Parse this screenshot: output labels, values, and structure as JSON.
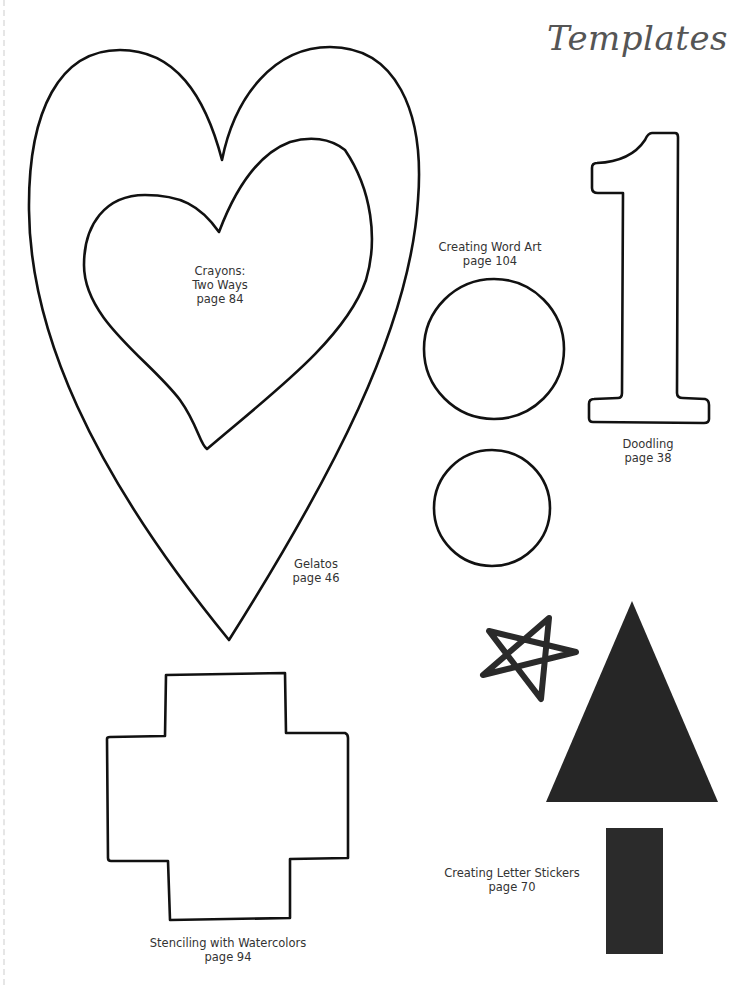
{
  "page": {
    "title": "Templates",
    "colors": {
      "outline": "#111111",
      "fill_dark": "#262626",
      "title": "#555555",
      "label": "#333333"
    }
  },
  "templates": [
    {
      "id": "heart-outer",
      "shape": "heart-outline",
      "label_lines": [
        "Gelatos",
        "page 46"
      ]
    },
    {
      "id": "heart-inner",
      "shape": "heart-outline",
      "label_lines": [
        "Crayons:",
        "Two Ways",
        "page 84"
      ]
    },
    {
      "id": "circles",
      "shape": "circle-outline",
      "count": 2,
      "label_lines": [
        "Creating Word Art",
        "page 104"
      ]
    },
    {
      "id": "number-one",
      "shape": "number-1-outline",
      "label_lines": [
        "Doodling",
        "page 38"
      ]
    },
    {
      "id": "cross",
      "shape": "cross-outline",
      "label_lines": [
        "Stenciling with Watercolors",
        "page 94"
      ]
    },
    {
      "id": "tree",
      "shape": "star-triangle-rectangle-solid",
      "label_lines": [
        "Creating Letter Stickers",
        "page 70"
      ]
    }
  ]
}
